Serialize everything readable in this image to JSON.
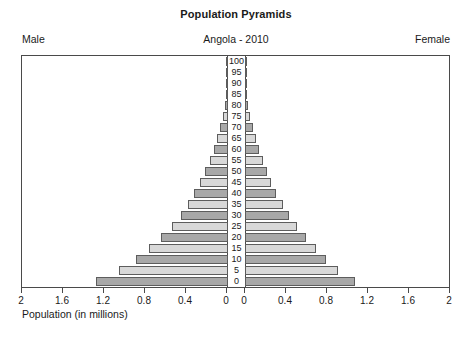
{
  "header": {
    "title": "Population Pyramids",
    "subtitle": "Angola - 2010",
    "male_label": "Male",
    "female_label": "Female"
  },
  "axis": {
    "xlabel": "Population (in millions)",
    "tick_labels_left": [
      "2",
      "1.6",
      "1.2",
      "0.8",
      "0.4",
      "0"
    ],
    "tick_labels_right": [
      "0",
      "0.4",
      "0.8",
      "1.2",
      "1.6",
      "2"
    ],
    "tick_values": [
      2,
      1.6,
      1.2,
      0.8,
      0.4,
      0
    ],
    "max": 2,
    "min": 0
  },
  "chart_data": {
    "type": "bar",
    "title": "Population Pyramids",
    "subtitle": "Angola - 2010",
    "xlabel": "Population (in millions)",
    "ylabel": "",
    "xlim": [
      2,
      2
    ],
    "ylim": [
      0,
      100
    ],
    "grid": false,
    "legend": [
      "Male",
      "Female"
    ],
    "legend_position": "top-outside",
    "orientation": "horizontal-diverging",
    "categories": [
      "0",
      "5",
      "10",
      "15",
      "20",
      "25",
      "30",
      "35",
      "40",
      "45",
      "50",
      "55",
      "60",
      "65",
      "70",
      "75",
      "80",
      "85",
      "90",
      "95",
      "100"
    ],
    "series": [
      {
        "name": "Male",
        "direction": "left",
        "values": [
          1.29,
          1.06,
          0.9,
          0.77,
          0.65,
          0.55,
          0.46,
          0.39,
          0.33,
          0.27,
          0.22,
          0.18,
          0.14,
          0.105,
          0.075,
          0.05,
          0.028,
          0.014,
          0.006,
          0.002,
          0.001
        ]
      },
      {
        "name": "Female",
        "direction": "right",
        "values": [
          1.08,
          0.92,
          0.8,
          0.7,
          0.6,
          0.51,
          0.43,
          0.37,
          0.31,
          0.26,
          0.215,
          0.175,
          0.14,
          0.107,
          0.078,
          0.053,
          0.031,
          0.016,
          0.007,
          0.002,
          0.001
        ]
      }
    ]
  },
  "style": {
    "bar_dark": "#a8a8a8",
    "bar_light": "#d8d8d8",
    "bar_border": "#5d5d5d",
    "frame": "#4a4a4a",
    "text": "#1a1a1a"
  }
}
